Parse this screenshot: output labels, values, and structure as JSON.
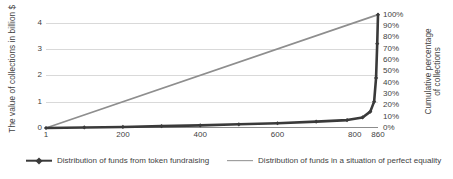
{
  "chart_data": {
    "type": "line",
    "title": "",
    "xlabel": "",
    "ylabel": "The value of collections in billion $",
    "ylabel_right_line1": "Cumulative percentage",
    "ylabel_right_line2": "of collections",
    "xlim": [
      1,
      860
    ],
    "ylim": [
      0,
      4.4
    ],
    "ylim_right": [
      0,
      100
    ],
    "grid": true,
    "legend_position": "bottom",
    "x_ticks": [
      {
        "label": "1",
        "value": 1
      },
      {
        "label": "200",
        "value": 200
      },
      {
        "label": "400",
        "value": 400
      },
      {
        "label": "600",
        "value": 600
      },
      {
        "label": "800",
        "value": 800
      },
      {
        "label": "860",
        "value": 860
      }
    ],
    "y_ticks_left": [
      {
        "label": "0",
        "value": 0
      },
      {
        "label": "1",
        "value": 1
      },
      {
        "label": "2",
        "value": 2
      },
      {
        "label": "3",
        "value": 3
      },
      {
        "label": "4",
        "value": 4
      }
    ],
    "y_ticks_right": [
      {
        "label": "100%",
        "value": 100
      },
      {
        "label": "90%",
        "value": 90
      },
      {
        "label": "80%",
        "value": 80
      },
      {
        "label": "70%",
        "value": 70
      },
      {
        "label": "60%",
        "value": 60
      },
      {
        "label": "50%",
        "value": 50
      },
      {
        "label": "40%",
        "value": 40
      },
      {
        "label": "30%",
        "value": 30
      },
      {
        "label": "20%",
        "value": 20
      },
      {
        "label": "10%",
        "value": 10
      },
      {
        "label": "0%",
        "value": 0
      }
    ],
    "series": [
      {
        "name": "Distribution of funds from token fundraising",
        "color": "#3a3a3a",
        "marker": "diamond",
        "x": [
          1,
          100,
          200,
          300,
          400,
          500,
          600,
          700,
          780,
          820,
          840,
          850,
          855,
          858,
          860
        ],
        "values": [
          0.0,
          0.02,
          0.04,
          0.07,
          0.1,
          0.14,
          0.18,
          0.24,
          0.3,
          0.4,
          0.62,
          1.0,
          1.9,
          3.2,
          4.3
        ]
      },
      {
        "name": "Distribution of funds in a situation of perfect equality",
        "color": "#8e8e8e",
        "marker": "none",
        "x": [
          1,
          860
        ],
        "values": [
          0.0,
          4.3
        ]
      }
    ],
    "legend": [
      {
        "label": "Distribution of funds from token fundraising",
        "color": "#3a3a3a",
        "marker": "diamond"
      },
      {
        "label": "Distribution of funds in a situation of perfect equality",
        "color": "#8e8e8e",
        "marker": "none"
      }
    ]
  },
  "colors": {
    "grid": "#d9d9d9",
    "axis": "#8c8c8c",
    "text": "#3f3f3f",
    "background": "#ffffff"
  }
}
